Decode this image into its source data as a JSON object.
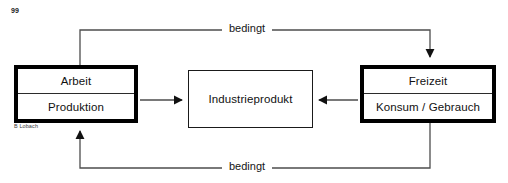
{
  "page": {
    "number": "99",
    "credit": "B Lobach",
    "background_color": "#ffffff",
    "line_color": "#4d4d4d",
    "box_border_color": "#000000"
  },
  "diagram": {
    "type": "flow-cycle",
    "nodes": [
      {
        "id": "arbeit",
        "style": "thick",
        "rows": [
          "Arbeit",
          "Produktion"
        ]
      },
      {
        "id": "industrieprodukt",
        "style": "thin",
        "rows": [
          "Industrieprodukt"
        ]
      },
      {
        "id": "freizeit",
        "style": "thick",
        "rows": [
          "Freizeit",
          "Konsum / Gebrauch"
        ]
      }
    ],
    "edges": [
      {
        "id": "produktion-to-industrieprodukt",
        "from": "arbeit",
        "to": "industrieprodukt",
        "label": "",
        "arrowhead": "to"
      },
      {
        "id": "konsum-to-industrieprodukt",
        "from": "freizeit",
        "to": "industrieprodukt",
        "label": "",
        "arrowhead": "to"
      },
      {
        "id": "arbeit-to-freizeit-top",
        "from": "arbeit",
        "to": "freizeit",
        "label": "bedingt",
        "arrowhead": "to"
      },
      {
        "id": "freizeit-to-arbeit-bottom",
        "from": "freizeit",
        "to": "arbeit",
        "label": "bedingt",
        "arrowhead": "to"
      }
    ]
  },
  "labels": {
    "arbeit": "Arbeit",
    "produktion": "Produktion",
    "industrieprodukt": "Industrieprodukt",
    "freizeit": "Freizeit",
    "konsum_gebrauch": "Konsum / Gebrauch",
    "bedingt_top": "bedingt",
    "bedingt_bottom": "bedingt"
  }
}
